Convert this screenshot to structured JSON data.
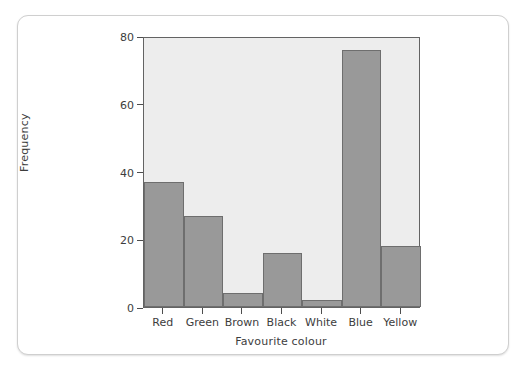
{
  "chart_data": {
    "type": "bar",
    "title": "",
    "subtitle": "",
    "xlabel": "Favourite colour",
    "ylabel": "Frequency",
    "categories": [
      "Red",
      "Green",
      "Brown",
      "Black",
      "White",
      "Blue",
      "Yellow"
    ],
    "values": [
      37,
      27,
      4,
      16,
      2,
      76,
      18
    ],
    "ylim": [
      0,
      80
    ],
    "yticks": [
      0,
      20,
      40,
      60,
      80
    ],
    "ytick_labels": [
      "0",
      "20",
      "40",
      "60",
      "80"
    ],
    "xlim_categories": 7,
    "grid": false,
    "legend": null,
    "bar_gap": 0,
    "annotations": []
  },
  "style": {
    "bar_fill": "#999999",
    "bar_stroke": "#6e6e6e",
    "panel_background": "#ededed",
    "panel_border": "#636363",
    "card_background": "#ffffff",
    "card_border": "#cfcfcf",
    "text_color": "#3d3d3d",
    "page_background": "#ffffff"
  }
}
